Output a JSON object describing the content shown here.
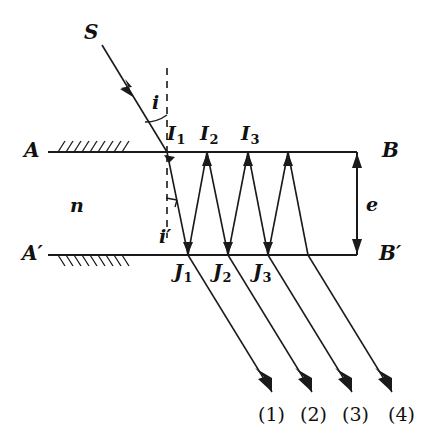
{
  "figure": {
    "type": "optics-ray-diagram",
    "background_color": "#ffffff",
    "ink_color": "#1a1a1a"
  },
  "labels": {
    "source_ray": "S",
    "incidence_angle": "i",
    "refraction_angle": "i′",
    "index": "n",
    "thickness": "e",
    "top_left_surface": "A",
    "top_right_surface": "B",
    "bottom_left_surface": "A′",
    "bottom_right_surface": "B′"
  },
  "top_points": [
    {
      "name": "I",
      "index": "1",
      "x": 167,
      "y": 152
    },
    {
      "name": "I",
      "index": "2",
      "x": 207,
      "y": 152
    },
    {
      "name": "I",
      "index": "3",
      "x": 248,
      "y": 152
    }
  ],
  "bottom_points": [
    {
      "name": "J",
      "index": "1",
      "x": 188,
      "y": 255
    },
    {
      "name": "J",
      "index": "2",
      "x": 228,
      "y": 255
    },
    {
      "name": "J",
      "index": "3",
      "x": 268,
      "y": 255
    }
  ],
  "emergent_rays": [
    {
      "label": "(1)"
    },
    {
      "label": "(2)"
    },
    {
      "label": "(3)"
    },
    {
      "label": "(4)"
    }
  ],
  "geometry": {
    "top_surface_y": 152,
    "bottom_surface_y": 255,
    "surface_x_start": 48,
    "surface_x_end": 357,
    "entry_x": 167,
    "normal_x": 167,
    "film_thickness_px": 103
  }
}
